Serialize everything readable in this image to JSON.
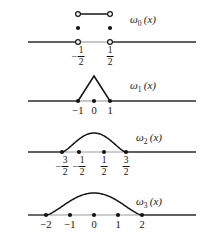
{
  "figure": {
    "kind": "math-diagram",
    "colors": {
      "curve": "#141414",
      "axis": "#2b2b2b",
      "axis_support": "#9c9c9c",
      "text": "#111111"
    }
  },
  "panels": [
    {
      "id": "omega0",
      "label": {
        "base": "ω",
        "sub": "0",
        "arg": "(x)"
      },
      "curve_type": "step-box",
      "axis": {
        "x_start": 28,
        "x_end": 196,
        "y": 42
      },
      "ticks": [
        {
          "value": "-1/2",
          "kind": "fraction",
          "sign": "−",
          "num": "1",
          "den": "2",
          "x": 78
        },
        {
          "value": "1/2",
          "kind": "fraction",
          "sign": "",
          "num": "1",
          "den": "2",
          "x": 110
        }
      ],
      "open_circles_top": [
        {
          "x": 78,
          "y": 14
        },
        {
          "x": 110,
          "y": 14
        }
      ],
      "open_circles_axis": [
        {
          "x": 78,
          "y": 42
        },
        {
          "x": 110,
          "y": 42
        }
      ],
      "filled_dots": [
        {
          "x": 78,
          "y": 28
        },
        {
          "x": 110,
          "y": 28
        }
      ],
      "top_segment": {
        "x1": 78,
        "x2": 110,
        "y": 14
      }
    },
    {
      "id": "omega1",
      "label": {
        "base": "ω",
        "sub": "1",
        "arg": "(x)"
      },
      "curve_type": "triangle",
      "axis": {
        "x_start": 28,
        "x_end": 196,
        "y": 101
      },
      "apex": {
        "x": 94,
        "y": 76
      },
      "ticks": [
        {
          "value": "-1",
          "kind": "integer",
          "text": "−1",
          "x": 78
        },
        {
          "value": "0",
          "kind": "integer",
          "text": "0",
          "x": 94
        },
        {
          "value": "1",
          "kind": "integer",
          "text": "1",
          "x": 110
        }
      ],
      "filled_dots": [
        {
          "x": 78,
          "y": 101
        },
        {
          "x": 94,
          "y": 101
        },
        {
          "x": 110,
          "y": 101
        }
      ]
    },
    {
      "id": "omega2",
      "label": {
        "base": "ω",
        "sub": "2",
        "arg": "(x)"
      },
      "curve_type": "smooth-bump",
      "axis": {
        "x_start": 28,
        "x_end": 196,
        "y": 152
      },
      "support": {
        "x_left": 62,
        "x_right": 126
      },
      "peak": {
        "x": 94,
        "y": 133
      },
      "ticks": [
        {
          "value": "-3/2",
          "kind": "fraction",
          "sign": "−",
          "num": "3",
          "den": "2",
          "x": 62
        },
        {
          "value": "-1/2",
          "kind": "fraction",
          "sign": "−",
          "num": "1",
          "den": "2",
          "x": 79
        },
        {
          "value": "1/2",
          "kind": "fraction",
          "sign": "",
          "num": "1",
          "den": "2",
          "x": 104
        },
        {
          "value": "3/2",
          "kind": "fraction",
          "sign": "",
          "num": "3",
          "den": "2",
          "x": 126
        }
      ],
      "filled_dots": [
        {
          "x": 62,
          "y": 152
        },
        {
          "x": 79,
          "y": 152
        },
        {
          "x": 104,
          "y": 152
        },
        {
          "x": 126,
          "y": 152
        }
      ]
    },
    {
      "id": "omega3",
      "label": {
        "base": "ω",
        "sub": "3",
        "arg": "(x)"
      },
      "curve_type": "smooth-bump",
      "axis": {
        "x_start": 28,
        "x_end": 196,
        "y": 215
      },
      "support": {
        "x_left": 46,
        "x_right": 142
      },
      "peak": {
        "x": 94,
        "y": 193
      },
      "ticks": [
        {
          "value": "-2",
          "kind": "integer",
          "text": "−2",
          "x": 46
        },
        {
          "value": "-1",
          "kind": "integer",
          "text": "−1",
          "x": 70
        },
        {
          "value": "0",
          "kind": "integer",
          "text": "0",
          "x": 94
        },
        {
          "value": "1",
          "kind": "integer",
          "text": "1",
          "x": 118
        },
        {
          "value": "2",
          "kind": "integer",
          "text": "2",
          "x": 142
        }
      ],
      "filled_dots": [
        {
          "x": 46,
          "y": 215
        },
        {
          "x": 70,
          "y": 215
        },
        {
          "x": 94,
          "y": 215
        },
        {
          "x": 118,
          "y": 215
        },
        {
          "x": 142,
          "y": 215
        }
      ]
    }
  ],
  "label_positions": [
    {
      "id": "omega0",
      "x": 130,
      "y": 14
    },
    {
      "id": "omega1",
      "x": 130,
      "y": 80
    },
    {
      "id": "omega2",
      "x": 136,
      "y": 132
    },
    {
      "id": "omega3",
      "x": 136,
      "y": 196
    }
  ]
}
